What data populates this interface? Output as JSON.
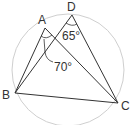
{
  "diagram": {
    "type": "geometry-circle-inscribed-quadrilateral",
    "points": {
      "A": "A",
      "B": "B",
      "C": "C",
      "D": "D"
    },
    "segments": [
      "AB",
      "AC",
      "BD",
      "DC",
      "BC"
    ],
    "circle": "circumcircle through A, B, C, D",
    "angles": [
      {
        "label": "65°",
        "vertex": "D",
        "between": [
          "DB",
          "DC"
        ]
      },
      {
        "label": "70°",
        "vertex": "A",
        "between": [
          "AB",
          "AC"
        ],
        "note": "marked with arrow leader"
      }
    ],
    "colors": {
      "lines": "#333333",
      "circle": "#cccccc",
      "text": "#333333"
    }
  }
}
